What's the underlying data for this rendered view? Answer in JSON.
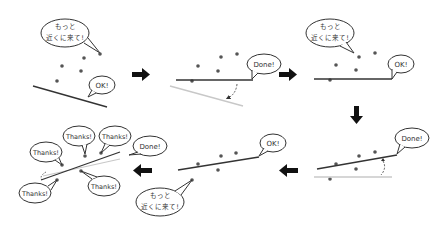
{
  "diagram": {
    "type": "iterative line fitting illustration",
    "colors": {
      "line": "#333333",
      "ghost_line": "#c8c8c8",
      "point": "#555555",
      "arrow": "#111111",
      "bubble_stroke": "#333333"
    },
    "bubbles": {
      "closer": [
        "もっと",
        "近くに来て!"
      ],
      "ok": "OK!",
      "done": "Done!",
      "thanks": "Thanks!"
    },
    "panels": [
      {
        "id": 1,
        "bubbles": [
          "もっと近くに来て!",
          "OK!"
        ]
      },
      {
        "id": 2,
        "bubbles": [
          "Done!"
        ]
      },
      {
        "id": 3,
        "bubbles": [
          "もっと近くに来て!",
          "OK!"
        ]
      },
      {
        "id": 4,
        "bubbles": [
          "Done!"
        ]
      },
      {
        "id": 5,
        "bubbles": [
          "OK!",
          "もっと近くに来て!"
        ]
      },
      {
        "id": 6,
        "bubbles": [
          "Thanks!",
          "Thanks!",
          "Thanks!",
          "Thanks!",
          "Thanks!",
          "Done!"
        ]
      }
    ],
    "flow": [
      "right",
      "right",
      "down",
      "left",
      "left"
    ]
  }
}
